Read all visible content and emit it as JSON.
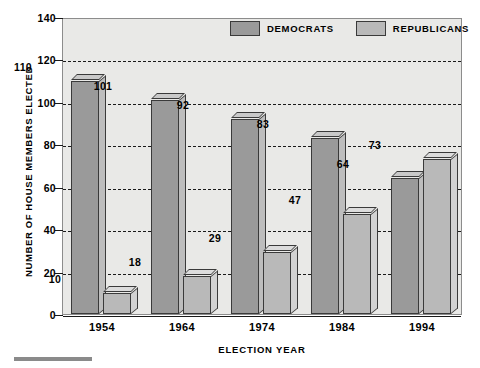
{
  "chart_data": {
    "type": "bar",
    "title": "",
    "xlabel": "ELECTION YEAR",
    "ylabel": "NUMBER OF HOUSE MEMBERS ELECTED",
    "categories": [
      "1954",
      "1964",
      "1974",
      "1984",
      "1994"
    ],
    "series": [
      {
        "name": "DEMOCRATS",
        "color": "#9a9a9a",
        "values": [
          110,
          101,
          92,
          83,
          64
        ]
      },
      {
        "name": "REPUBLICANS",
        "color": "#b9b9b9",
        "values": [
          10,
          18,
          29,
          47,
          73
        ]
      }
    ],
    "ylim": [
      0,
      140
    ],
    "yticks": [
      0,
      20,
      40,
      60,
      80,
      100,
      120,
      140
    ],
    "ytick_labels": [
      "0",
      "20",
      "40",
      "60",
      "80",
      "100",
      "120",
      "140"
    ],
    "grid": true,
    "grid_style": "dashed",
    "legend_position": "top-center",
    "plot_background": "#e9e9e7",
    "bar_style": "3d"
  }
}
